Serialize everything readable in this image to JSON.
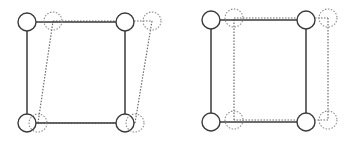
{
  "diagrams": [
    {
      "name": "shear-deformation-frame",
      "original": {
        "nodes": [
          {
            "x": 27,
            "y": 22
          },
          {
            "x": 125,
            "y": 22
          },
          {
            "x": 125,
            "y": 123
          },
          {
            "x": 27,
            "y": 123
          }
        ],
        "style": "solid"
      },
      "deformed": {
        "nodes": [
          {
            "x": 53,
            "y": 21
          },
          {
            "x": 152,
            "y": 21
          },
          {
            "x": 135,
            "y": 123
          },
          {
            "x": 38,
            "y": 123
          }
        ],
        "style": "dashed"
      }
    },
    {
      "name": "translation-frame",
      "original": {
        "nodes": [
          {
            "x": 211,
            "y": 20
          },
          {
            "x": 306,
            "y": 20
          },
          {
            "x": 306,
            "y": 122
          },
          {
            "x": 211,
            "y": 122
          }
        ],
        "style": "solid"
      },
      "deformed": {
        "nodes": [
          {
            "x": 234,
            "y": 18
          },
          {
            "x": 328,
            "y": 18
          },
          {
            "x": 328,
            "y": 120
          },
          {
            "x": 234,
            "y": 120
          }
        ],
        "style": "dashed"
      }
    }
  ],
  "node_radius": 9,
  "colors": {
    "solid": "#3a3a3a",
    "dashed": "#8a8a8a",
    "background": "#ffffff"
  }
}
